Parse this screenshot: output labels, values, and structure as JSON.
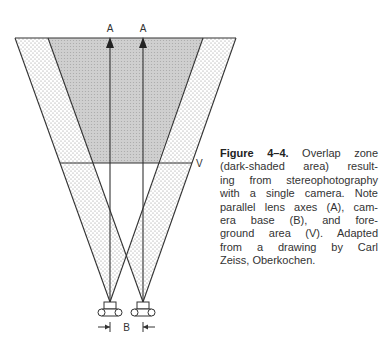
{
  "figure": {
    "labels": {
      "axis_left": "A",
      "axis_right": "A",
      "base": "B",
      "foreground": "V"
    },
    "caption": {
      "figure_number": "Figure 4–4.",
      "lines": [
        " Overlap zone",
        "(dark-shaded area) result-",
        "ing from stereophotography",
        "with a single camera. Note",
        "parallel lens axes (A), cam-",
        "era base (B), and fore-",
        "ground area (V). Adapted",
        "from a drawing by Carl",
        "Zeiss, Oberkochen."
      ]
    },
    "colors": {
      "overlap_shade": "#c8c8c8",
      "stipple": "#9a9a9a",
      "line": "#333333"
    }
  }
}
